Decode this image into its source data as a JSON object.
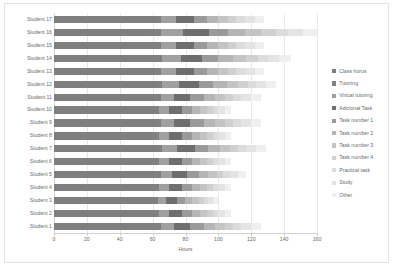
{
  "chart_data": {
    "type": "bar",
    "subtype": "horizontal-stacked",
    "title": "",
    "xlabel": "Hours",
    "ylabel": "",
    "xlim": [
      0,
      160
    ],
    "ylim": null,
    "grid": true,
    "legend_position": "right",
    "xticks": [
      0,
      20,
      40,
      60,
      80,
      100,
      120,
      140,
      160
    ],
    "xtick_labels": [
      "0",
      "20",
      "40",
      "60",
      "80",
      "100",
      "120",
      "140",
      "160"
    ],
    "categories": [
      "Student 1",
      "Student 2",
      "Student 3",
      "Student 4",
      "Student 5",
      "Student 6",
      "Student 7",
      "Student 8",
      "Student 9",
      "Student 10",
      "Student 11",
      "Student 12",
      "Student 13",
      "Student 14",
      "Student 15",
      "Student 16",
      "Student 17"
    ],
    "categories_top_to_bottom": [
      "Student 17",
      "Student 16",
      "Student 15",
      "Student 14",
      "Student 13",
      "Student 12",
      "Student 11",
      "Student 10",
      "Student 9",
      "Student 8",
      "Student 7",
      "Student 6",
      "Student 5",
      "Student 4",
      "Student 3",
      "Student 2",
      "Student 1"
    ],
    "series": [
      {
        "name": "Class horus",
        "color": "#7f7f7f",
        "values": [
          60,
          60,
          60,
          60,
          60,
          60,
          60,
          60,
          60,
          60,
          60,
          60,
          60,
          60,
          60,
          60,
          60
        ]
      },
      {
        "name": "Tutoring",
        "color": "#808080",
        "values": [
          5,
          4,
          3,
          4,
          5,
          4,
          6,
          4,
          5,
          4,
          5,
          6,
          5,
          6,
          5,
          7,
          5
        ]
      },
      {
        "name": "Virtual tutoring",
        "color": "#a0a0a0",
        "values": [
          8,
          6,
          5,
          6,
          7,
          6,
          9,
          6,
          8,
          6,
          8,
          10,
          9,
          11,
          9,
          14,
          9
        ]
      },
      {
        "name": "Adicional Task",
        "color": "#6e6e6e",
        "values": [
          10,
          8,
          7,
          8,
          9,
          8,
          11,
          8,
          10,
          8,
          10,
          12,
          11,
          13,
          11,
          16,
          11
        ]
      },
      {
        "name": "Task number 1",
        "color": "#9a9a9a",
        "values": [
          8,
          6,
          5,
          6,
          7,
          6,
          8,
          6,
          8,
          6,
          8,
          9,
          8,
          10,
          8,
          12,
          8
        ]
      },
      {
        "name": "Task number 2",
        "color": "#b5b5b5",
        "values": [
          7,
          5,
          4,
          5,
          6,
          5,
          7,
          5,
          7,
          5,
          7,
          8,
          7,
          9,
          7,
          11,
          7
        ]
      },
      {
        "name": "Task number 3",
        "color": "#c4c4c4",
        "values": [
          6,
          4,
          4,
          4,
          5,
          4,
          6,
          4,
          6,
          4,
          6,
          7,
          6,
          8,
          6,
          10,
          6
        ]
      },
      {
        "name": "Task number 4",
        "color": "#d0d0d0",
        "values": [
          5,
          4,
          3,
          4,
          4,
          4,
          5,
          4,
          5,
          4,
          5,
          6,
          5,
          7,
          5,
          9,
          5
        ]
      },
      {
        "name": "Practical task",
        "color": "#dcdcdc",
        "values": [
          5,
          3,
          3,
          3,
          4,
          3,
          5,
          3,
          5,
          3,
          5,
          5,
          5,
          6,
          5,
          8,
          5
        ]
      },
      {
        "name": "Study",
        "color": "#e4e4e4",
        "values": [
          6,
          4,
          3,
          4,
          5,
          4,
          6,
          4,
          6,
          4,
          6,
          6,
          6,
          7,
          6,
          9,
          6
        ]
      },
      {
        "name": "Other",
        "color": "#efefef",
        "values": [
          6,
          4,
          3,
          4,
          5,
          4,
          6,
          4,
          6,
          4,
          6,
          6,
          6,
          7,
          6,
          9,
          6
        ]
      }
    ],
    "totals": [
      126,
      108,
      100,
      108,
      117,
      108,
      129,
      108,
      126,
      108,
      126,
      135,
      128,
      144,
      128,
      165,
      128
    ]
  },
  "legend": {
    "items": [
      {
        "label": "Class horus",
        "color": "#7f7f7f"
      },
      {
        "label": "Tutoring",
        "color": "#808080"
      },
      {
        "label": "Virtual tutoring",
        "color": "#a0a0a0"
      },
      {
        "label": "Adicional Task",
        "color": "#6e6e6e"
      },
      {
        "label": "Task number 1",
        "color": "#9a9a9a"
      },
      {
        "label": "Task number 2",
        "color": "#b5b5b5"
      },
      {
        "label": "Task number 3",
        "color": "#c4c4c4"
      },
      {
        "label": "Task number 4",
        "color": "#d0d0d0"
      },
      {
        "label": "Practical task",
        "color": "#dcdcdc"
      },
      {
        "label": "Study",
        "color": "#e4e4e4"
      },
      {
        "label": "Other",
        "color": "#efefef"
      }
    ]
  }
}
